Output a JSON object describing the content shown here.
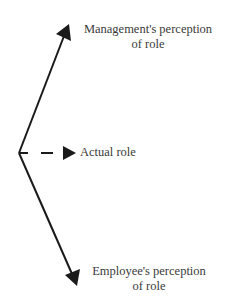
{
  "diagram": {
    "type": "divergent-arrows",
    "origin": {
      "x": 19,
      "y": 153
    },
    "arrows": [
      {
        "id": "management",
        "style": "solid",
        "tip": {
          "x": 69,
          "y": 24
        }
      },
      {
        "id": "actual",
        "style": "dashed",
        "tip": {
          "x": 77,
          "y": 153
        }
      },
      {
        "id": "employee",
        "style": "solid",
        "tip": {
          "x": 77,
          "y": 286
        }
      }
    ],
    "stroke_color": "#1a1a1a",
    "labels": {
      "management_line1": "Management's perception",
      "management_line2": "of role",
      "actual": "Actual role",
      "employee_line1": "Employee's perception",
      "employee_line2": "of role"
    }
  }
}
